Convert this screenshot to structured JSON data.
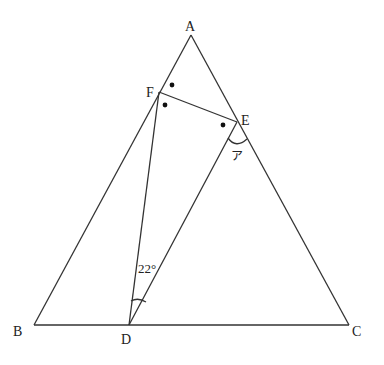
{
  "figure": {
    "type": "geometry-diagram",
    "points": {
      "A": {
        "label": "A",
        "x": 191,
        "y": 35,
        "lx": 186,
        "ly": 31
      },
      "B": {
        "label": "B",
        "x": 34,
        "y": 325,
        "lx": 14,
        "ly": 337
      },
      "C": {
        "label": "C",
        "x": 349,
        "y": 325,
        "lx": 352,
        "ly": 337
      },
      "D": {
        "label": "D",
        "x": 129,
        "y": 325,
        "lx": 121,
        "ly": 344
      },
      "E": {
        "label": "E",
        "x": 237,
        "y": 122,
        "lx": 241,
        "ly": 124
      },
      "F": {
        "label": "F",
        "x": 159,
        "y": 92,
        "lx": 146,
        "ly": 97
      }
    },
    "segments": [
      [
        "A",
        "B"
      ],
      [
        "B",
        "C"
      ],
      [
        "C",
        "A"
      ],
      [
        "F",
        "E"
      ],
      [
        "F",
        "D"
      ],
      [
        "E",
        "D"
      ]
    ],
    "angle_label_22": "22°",
    "angle_label_a": "ア",
    "marks": [
      {
        "x": 172,
        "y": 85
      },
      {
        "x": 165,
        "y": 105
      },
      {
        "x": 223,
        "y": 125
      }
    ],
    "line_color": "#333333"
  }
}
